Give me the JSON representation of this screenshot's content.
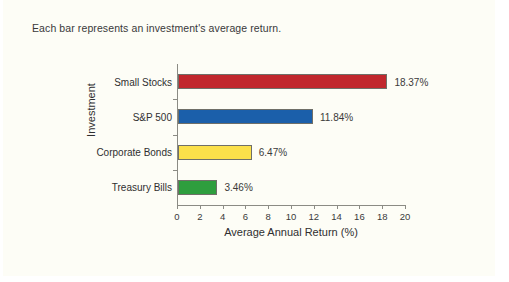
{
  "caption": "Each bar represents an investment's average return.",
  "chart_data": {
    "type": "bar",
    "orientation": "horizontal",
    "title": "",
    "xlabel": "Average Annual Return (%)",
    "ylabel": "Investment",
    "xlim": [
      0,
      20
    ],
    "xticks": [
      0,
      2,
      4,
      6,
      8,
      10,
      12,
      14,
      16,
      18,
      20
    ],
    "grid": false,
    "legend": "none",
    "categories": [
      "Small Stocks",
      "S&P 500",
      "Corporate Bonds",
      "Treasury Bills"
    ],
    "values": [
      18.37,
      11.84,
      6.47,
      3.46
    ],
    "value_labels": [
      "18.37%",
      "11.84%",
      "6.47%",
      "3.46%"
    ],
    "colors": [
      "#c1272d",
      "#1b5faa",
      "#fbe04a",
      "#2e9e3e"
    ]
  }
}
